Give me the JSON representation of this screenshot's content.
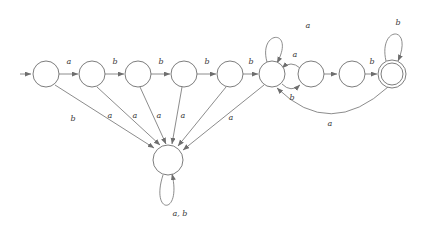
{
  "diagram": {
    "type": "state-machine",
    "alphabet": [
      "a",
      "b"
    ],
    "stroke_color": "#6e6e6e",
    "label_color": "#3a3a3a",
    "background_color": "#ffffff"
  },
  "states": [
    {
      "id": "q1",
      "label": "",
      "cx": 46,
      "cy": 74,
      "r": 13,
      "accepting": false,
      "start": true
    },
    {
      "id": "q2",
      "label": "",
      "cx": 92,
      "cy": 74,
      "r": 13,
      "accepting": false,
      "start": false
    },
    {
      "id": "q3",
      "label": "",
      "cx": 138,
      "cy": 74,
      "r": 13,
      "accepting": false,
      "start": false
    },
    {
      "id": "q4",
      "label": "",
      "cx": 184,
      "cy": 74,
      "r": 13,
      "accepting": false,
      "start": false
    },
    {
      "id": "q5",
      "label": "",
      "cx": 230,
      "cy": 74,
      "r": 13,
      "accepting": false,
      "start": false
    },
    {
      "id": "q6",
      "label": "",
      "cx": 272,
      "cy": 74,
      "r": 13,
      "accepting": false,
      "start": false
    },
    {
      "id": "q7",
      "label": "",
      "cx": 311,
      "cy": 74,
      "r": 13,
      "accepting": false,
      "start": false
    },
    {
      "id": "q8",
      "label": "",
      "cx": 352,
      "cy": 74,
      "r": 13,
      "accepting": false,
      "start": false
    },
    {
      "id": "q9",
      "label": "",
      "cx": 392,
      "cy": 74,
      "r": 14,
      "accepting": true,
      "start": false
    },
    {
      "id": "dead",
      "label": "",
      "cx": 168,
      "cy": 160,
      "r": 15,
      "accepting": false,
      "start": false
    }
  ],
  "start_arrow": {
    "label": "",
    "from_x": 20,
    "to_x": 32,
    "y": 74
  },
  "transitions": [
    {
      "from": "q1",
      "to": "q2",
      "label": "a",
      "label_x": 69,
      "label_y": 64
    },
    {
      "from": "q2",
      "to": "q3",
      "label": "b",
      "label_x": 115,
      "label_y": 64
    },
    {
      "from": "q3",
      "to": "q4",
      "label": "b",
      "label_x": 161,
      "label_y": 64
    },
    {
      "from": "q4",
      "to": "q5",
      "label": "b",
      "label_x": 207,
      "label_y": 64
    },
    {
      "from": "q5",
      "to": "q6",
      "label": "b",
      "label_x": 251,
      "label_y": 64
    },
    {
      "from": "q7",
      "to": "q8",
      "label": "",
      "label_x": 0,
      "label_y": 0
    },
    {
      "from": "q8",
      "to": "q9",
      "label": "b",
      "label_x": 372,
      "label_y": 64
    },
    {
      "from": "q1",
      "to": "dead",
      "label": "b",
      "label_x": 73,
      "label_y": 121
    },
    {
      "from": "q2",
      "to": "dead",
      "label": "a",
      "label_x": 110,
      "label_y": 118
    },
    {
      "from": "q3",
      "to": "dead",
      "label": "a",
      "label_x": 135,
      "label_y": 118
    },
    {
      "from": "q4",
      "to": "dead",
      "label": "a",
      "label_x": 159,
      "label_y": 118
    },
    {
      "from": "q5",
      "to": "dead",
      "label": "a",
      "label_x": 183,
      "label_y": 118
    },
    {
      "from": "q6",
      "to": "dead",
      "label": "a",
      "label_x": 231,
      "label_y": 120
    },
    {
      "from": "q7",
      "to": "q6",
      "label": "a",
      "label_x": 295,
      "label_y": 57
    },
    {
      "from": "q6",
      "to": "q7",
      "label": "b",
      "label_x": 292,
      "label_y": 97
    },
    {
      "from": "q9",
      "to": "q7",
      "label": "a",
      "label_x": 330,
      "label_y": 123
    },
    {
      "from": "q7",
      "to": "q7",
      "label": "a",
      "label_x": 308,
      "label_y": 25,
      "self_loop": true
    },
    {
      "from": "q9",
      "to": "q9",
      "label": "b",
      "label_x": 398,
      "label_y": 22,
      "self_loop": true
    },
    {
      "from": "dead",
      "to": "dead",
      "label": "a, b",
      "label_x": 178,
      "label_y": 214,
      "self_loop": true
    }
  ]
}
